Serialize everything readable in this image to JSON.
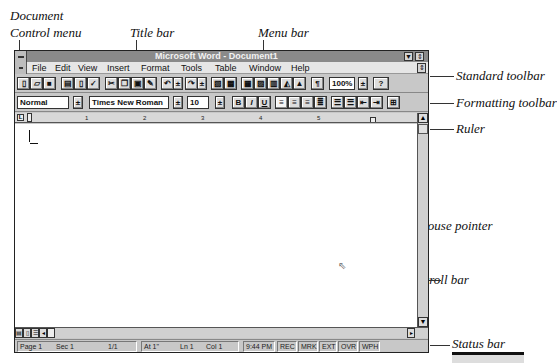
{
  "callouts": {
    "doc_control_line1": "Document",
    "doc_control_line2": "Control menu",
    "title_bar": "Title bar",
    "menu_bar": "Menu bar",
    "standard_toolbar": "Standard toolbar",
    "formatting_toolbar": "Formatting toolbar",
    "ruler": "Ruler",
    "mouse_pointer": "Mouse pointer",
    "scroll_bar": "Scroll bar",
    "status_bar": "Status bar"
  },
  "window": {
    "title": "Microsoft Word - Document1",
    "minimize_glyph": "▼",
    "maximize_glyph": "⇕",
    "restore_glyph": "⇕"
  },
  "menu": {
    "items": [
      "File",
      "Edit",
      "View",
      "Insert",
      "Format",
      "Tools",
      "Table",
      "Window",
      "Help"
    ]
  },
  "standard_toolbar": {
    "buttons": [
      "new",
      "open",
      "save",
      "print",
      "print-preview",
      "spelling",
      "cut",
      "copy",
      "paste",
      "format-painter",
      "undo",
      "undo-dropdown",
      "redo",
      "redo-dropdown",
      "autoformat",
      "insert-address",
      "insert-table",
      "insert-excel",
      "columns",
      "drawing",
      "chart",
      "show-hide"
    ],
    "zoom": "100%",
    "help_glyph": "?"
  },
  "formatting_toolbar": {
    "style": "Normal",
    "font": "Times New Roman",
    "size": "10",
    "bold": "B",
    "italic": "I",
    "underline": "U",
    "align": [
      "left",
      "center",
      "right",
      "justify"
    ],
    "lists": [
      "numbering",
      "bullets",
      "decrease-indent",
      "increase-indent"
    ],
    "borders": "borders"
  },
  "ruler": {
    "tab_selector": "L",
    "numbers": [
      "1",
      "2",
      "3",
      "4",
      "5"
    ]
  },
  "status": {
    "page": "Page 1",
    "section": "Sec 1",
    "pages": "1/1",
    "at": "At 1\"",
    "line": "Ln 1",
    "col": "Col 1",
    "time": "9:44 PM",
    "indicators": [
      "REC",
      "MRK",
      "EXT",
      "OVR",
      "WPH"
    ]
  }
}
